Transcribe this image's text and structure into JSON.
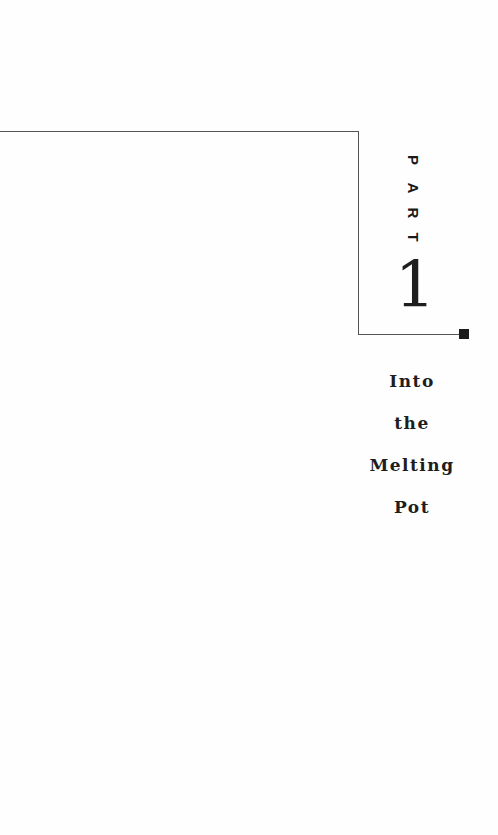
{
  "part": {
    "label_letters": [
      "P",
      "A",
      "R",
      "T"
    ],
    "number": "1"
  },
  "title": {
    "lines": [
      "Into",
      "the",
      "Melting",
      "Pot"
    ]
  },
  "colors": {
    "background": "#fefefe",
    "rule_line": "#555555",
    "square_marker": "#1b1b1b",
    "text": "#1e1e1e"
  }
}
